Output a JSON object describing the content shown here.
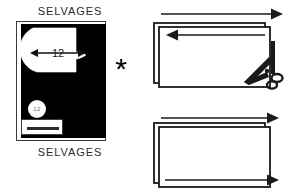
{
  "figure": {
    "background_color": "#ffffff",
    "ink_color": "#000000"
  },
  "layout_panel": {
    "name": "fabric-layout",
    "selvage_top_label": "SELVAGES",
    "selvage_bottom_label": "SELVAGES",
    "fabric_fill_color": "#000000",
    "pattern_piece_fill_color": "#ffffff",
    "dimension": {
      "value": "12",
      "arrow_style": "double-headed-horizontal"
    },
    "piece_marker": {
      "shape": "circle",
      "label": "12"
    },
    "tag": {
      "shape": "rectangle",
      "has_bar": true
    }
  },
  "separator": {
    "symbol": "*",
    "name": "asterisk-separator"
  },
  "steps": [
    {
      "id": "step-cut",
      "name": "fold-and-cut-step",
      "description": "Folded fabric rectangle with selvage direction arrows and scissors cutting at the lower right corner",
      "arrows": [
        {
          "name": "top-edge-arrow",
          "direction": "right"
        },
        {
          "name": "inner-edge-arrow",
          "direction": "left"
        }
      ],
      "tool": {
        "name": "scissors-icon",
        "position": "bottom-right"
      }
    },
    {
      "id": "step-done",
      "name": "cut-result-step",
      "description": "Two stacked rectangles after cutting with both direction arrows pointing right",
      "arrows": [
        {
          "name": "top-edge-arrow",
          "direction": "right"
        },
        {
          "name": "bottom-edge-arrow",
          "direction": "right"
        }
      ],
      "tool": null
    }
  ]
}
